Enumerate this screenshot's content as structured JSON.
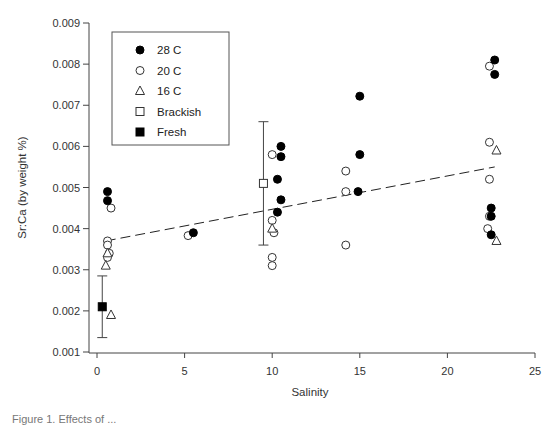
{
  "chart_data": {
    "type": "scatter",
    "title": "",
    "xlabel": "Salinity",
    "ylabel": "Sr:Ca (by weight %)",
    "xlim": [
      0,
      25
    ],
    "ylim": [
      0.001,
      0.009
    ],
    "xticks": [
      0,
      5,
      10,
      15,
      20,
      25
    ],
    "xtick_labels": [
      "0",
      "5",
      "10",
      "15",
      "20",
      "25"
    ],
    "yticks": [
      0.001,
      0.002,
      0.003,
      0.004,
      0.005,
      0.006,
      0.007,
      0.008,
      0.009
    ],
    "ytick_labels": [
      "0.001",
      "0.002",
      "0.003",
      "0.004",
      "0.005",
      "0.006",
      "0.007",
      "0.008",
      "0.009"
    ],
    "grid": false,
    "legend_position": "upper-left (inside)",
    "legend": [
      "28 C",
      "20 C",
      "16 C",
      "Brackish",
      "Fresh"
    ],
    "series": [
      {
        "name": "28 C",
        "marker": "filled-circle",
        "points": [
          [
            0.6,
            0.0049
          ],
          [
            0.6,
            0.00468
          ],
          [
            5.5,
            0.0039
          ],
          [
            10.5,
            0.006
          ],
          [
            10.5,
            0.00575
          ],
          [
            10.3,
            0.0052
          ],
          [
            10.5,
            0.0047
          ],
          [
            10.3,
            0.0044
          ],
          [
            15.0,
            0.00722
          ],
          [
            15.0,
            0.0058
          ],
          [
            14.9,
            0.0049
          ],
          [
            22.7,
            0.0081
          ],
          [
            22.7,
            0.00775
          ],
          [
            22.5,
            0.0045
          ],
          [
            22.5,
            0.0043
          ],
          [
            22.5,
            0.00385
          ]
        ]
      },
      {
        "name": "20 C",
        "marker": "open-circle",
        "points": [
          [
            0.8,
            0.0045
          ],
          [
            0.6,
            0.0037
          ],
          [
            0.6,
            0.0036
          ],
          [
            0.7,
            0.0034
          ],
          [
            0.6,
            0.0033
          ],
          [
            5.2,
            0.00383
          ],
          [
            10.0,
            0.0058
          ],
          [
            10.0,
            0.0042
          ],
          [
            10.1,
            0.0039
          ],
          [
            10.0,
            0.0033
          ],
          [
            10.0,
            0.0031
          ],
          [
            14.2,
            0.0054
          ],
          [
            14.2,
            0.0049
          ],
          [
            14.2,
            0.0036
          ],
          [
            22.4,
            0.00795
          ],
          [
            22.4,
            0.0061
          ],
          [
            22.4,
            0.0052
          ],
          [
            22.4,
            0.0043
          ],
          [
            22.3,
            0.004
          ]
        ]
      },
      {
        "name": "16 C",
        "marker": "open-triangle",
        "points": [
          [
            0.6,
            0.0034
          ],
          [
            0.5,
            0.0031
          ],
          [
            0.8,
            0.0019
          ],
          [
            10.0,
            0.004
          ],
          [
            22.8,
            0.0059
          ],
          [
            22.8,
            0.0037
          ]
        ]
      },
      {
        "name": "Brackish",
        "marker": "open-square",
        "points": [
          [
            9.5,
            0.0051
          ]
        ],
        "error_bars": [
          [
            0.0036,
            0.0066
          ]
        ]
      },
      {
        "name": "Fresh",
        "marker": "filled-square",
        "points": [
          [
            0.3,
            0.0021
          ]
        ],
        "error_bars": [
          [
            0.00135,
            0.00285
          ]
        ]
      }
    ],
    "trendline": {
      "style": "dashed",
      "start": [
        0.5,
        0.0037
      ],
      "end": [
        22.7,
        0.0055
      ]
    }
  },
  "caption_partial": "Figure 1.  Effects of ..."
}
